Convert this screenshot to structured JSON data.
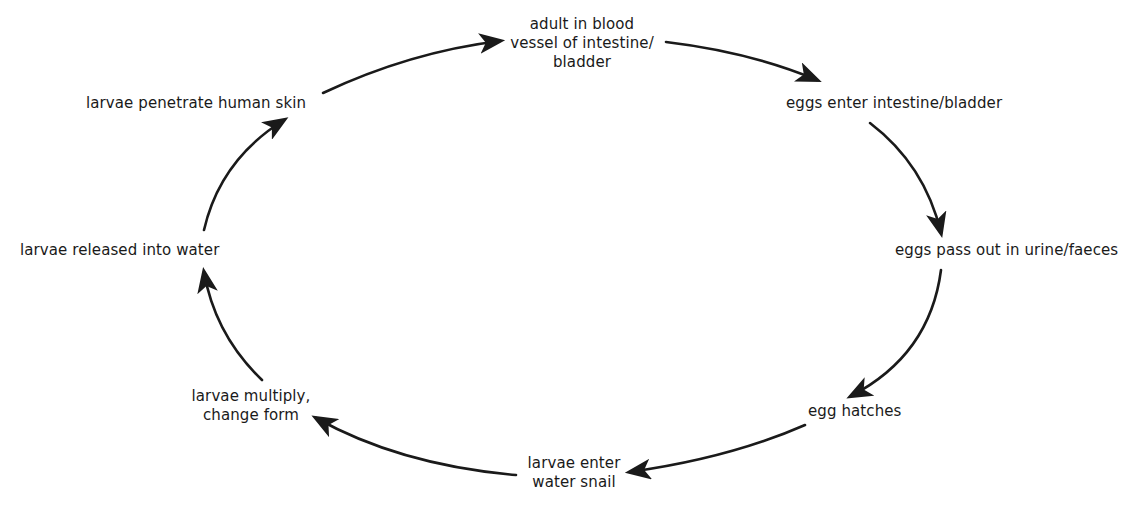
{
  "diagram": {
    "type": "cycle",
    "nodes": [
      {
        "id": "adult",
        "lines": [
          "adult in blood",
          "vessel of intestine/",
          "bladder"
        ]
      },
      {
        "id": "eggs-enter",
        "lines": [
          "eggs enter intestine/bladder"
        ]
      },
      {
        "id": "eggs-pass",
        "lines": [
          "eggs pass out in urine/faeces"
        ]
      },
      {
        "id": "egg-hatches",
        "lines": [
          "egg hatches"
        ]
      },
      {
        "id": "larvae-snail",
        "lines": [
          "larvae enter",
          "water snail"
        ]
      },
      {
        "id": "larvae-multiply",
        "lines": [
          "larvae multiply,",
          "change form"
        ]
      },
      {
        "id": "larvae-released",
        "lines": [
          "larvae released into water"
        ]
      },
      {
        "id": "larvae-penetrate",
        "lines": [
          "larvae penetrate human skin"
        ]
      }
    ],
    "edges": [
      {
        "from": "larvae-penetrate",
        "to": "adult"
      },
      {
        "from": "adult",
        "to": "eggs-enter"
      },
      {
        "from": "eggs-enter",
        "to": "eggs-pass"
      },
      {
        "from": "eggs-pass",
        "to": "egg-hatches"
      },
      {
        "from": "egg-hatches",
        "to": "larvae-snail"
      },
      {
        "from": "larvae-snail",
        "to": "larvae-multiply"
      },
      {
        "from": "larvae-multiply",
        "to": "larvae-released"
      },
      {
        "from": "larvae-released",
        "to": "larvae-penetrate"
      }
    ],
    "colors": {
      "ink": "#1a1a1a",
      "background": "#ffffff"
    }
  }
}
